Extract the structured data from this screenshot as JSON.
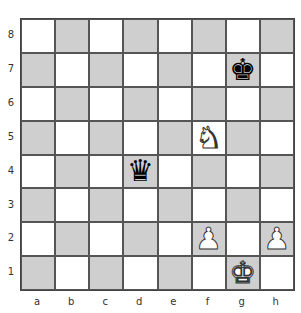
{
  "board": {
    "ranks": [
      "8",
      "7",
      "6",
      "5",
      "4",
      "3",
      "2",
      "1"
    ],
    "files": [
      "a",
      "b",
      "c",
      "d",
      "e",
      "f",
      "g",
      "h"
    ],
    "colors": {
      "light": "#ffffff",
      "dark": "#cfcfcf"
    },
    "pieces": [
      {
        "square": "g7",
        "color": "black",
        "type": "king",
        "glyph": "♚"
      },
      {
        "square": "f5",
        "color": "white",
        "type": "knight",
        "glyph": "♞"
      },
      {
        "square": "d4",
        "color": "black",
        "type": "queen",
        "glyph": "♛"
      },
      {
        "square": "f2",
        "color": "white",
        "type": "pawn",
        "glyph": "♟"
      },
      {
        "square": "h2",
        "color": "white",
        "type": "pawn",
        "glyph": "♟"
      },
      {
        "square": "g1",
        "color": "white",
        "type": "king",
        "glyph": "♚"
      }
    ]
  }
}
